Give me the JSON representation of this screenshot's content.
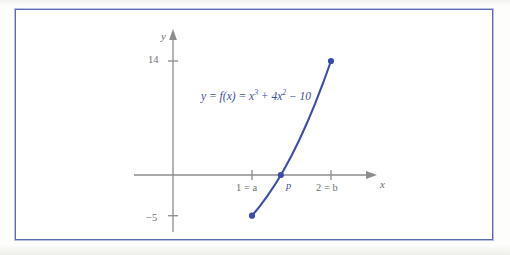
{
  "figure": {
    "frame_color": "#5a6cb0",
    "background": "#ffffff",
    "curve_color": "#3b4ea6",
    "axis_color": "#8c8c8c",
    "label_color": "#6e6e6e"
  },
  "axes": {
    "x_axis_label": "x",
    "y_axis_label": "y"
  },
  "labels": {
    "equation_prefix": "y = f(x) = x",
    "equation_exp1": "3",
    "equation_mid": " + 4x",
    "equation_exp2": "2",
    "equation_suffix": " − 10",
    "equation_full": "y = f(x) = x³ + 4x² − 10",
    "point_p": "p",
    "tick_a": "1 = a",
    "tick_b": "2 = b",
    "tick_14": "14",
    "tick_neg5": "−5"
  },
  "chart_data": {
    "type": "line",
    "title": "",
    "function": "y = f(x) = x³ + 4x² − 10",
    "xlabel": "x",
    "ylabel": "y",
    "xlim": [
      0,
      2.35
    ],
    "ylim": [
      -6.5,
      16
    ],
    "grid": false,
    "legend": null,
    "x_ticks": [
      {
        "value": 1,
        "label": "1 = a"
      },
      {
        "value": 2,
        "label": "2 = b"
      }
    ],
    "y_ticks": [
      {
        "value": 14,
        "label": "14"
      },
      {
        "value": -5,
        "label": "−5"
      }
    ],
    "series": [
      {
        "name": "f(x) = x^3 + 4x^2 - 10",
        "x": [
          1.0,
          1.1,
          1.2,
          1.3,
          1.365,
          1.4,
          1.5,
          1.6,
          1.7,
          1.8,
          1.9,
          2.0
        ],
        "values": [
          -5.0,
          -3.829,
          -2.512,
          -1.043,
          0.0,
          0.584,
          2.375,
          4.336,
          6.473,
          8.792,
          11.299,
          14.0
        ]
      }
    ],
    "annotations": [
      {
        "label": "p",
        "x": 1.365,
        "y": 0,
        "kind": "root-marker"
      },
      {
        "label": "",
        "x": 1.0,
        "y": -5.0,
        "kind": "endpoint-marker"
      },
      {
        "label": "",
        "x": 2.0,
        "y": 14.0,
        "kind": "endpoint-marker"
      }
    ]
  }
}
